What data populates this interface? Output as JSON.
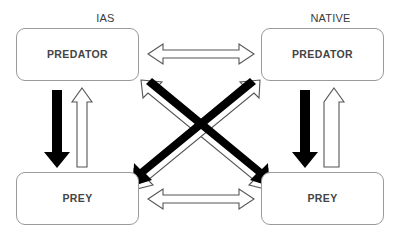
{
  "diagram": {
    "groups": [
      {
        "id": "ias",
        "label": "IAS"
      },
      {
        "id": "native",
        "label": "NATIVE"
      }
    ],
    "nodes": [
      {
        "id": "ias-predator",
        "label": "PREDATOR",
        "group": "IAS"
      },
      {
        "id": "native-predator",
        "label": "PREDATOR",
        "group": "NATIVE"
      },
      {
        "id": "ias-prey",
        "label": "PREY",
        "group": "IAS"
      },
      {
        "id": "native-prey",
        "label": "PREY",
        "group": "NATIVE"
      }
    ],
    "arrows": [
      {
        "id": "ias-predator-to-ias-prey",
        "style": "solid-black",
        "heads": "single",
        "from": "ias-predator",
        "to": "ias-prey",
        "orientation": "vertical-down"
      },
      {
        "id": "ias-prey-to-ias-predator",
        "style": "hollow-white",
        "heads": "single",
        "from": "ias-prey",
        "to": "ias-predator",
        "orientation": "vertical-up"
      },
      {
        "id": "native-predator-to-native-prey",
        "style": "solid-black",
        "heads": "single",
        "from": "native-predator",
        "to": "native-prey",
        "orientation": "vertical-down"
      },
      {
        "id": "native-prey-to-native-predator",
        "style": "hollow-white",
        "heads": "single",
        "from": "native-prey",
        "to": "native-predator",
        "orientation": "vertical-up"
      },
      {
        "id": "predator-predator-competition",
        "style": "hollow-white",
        "heads": "double",
        "from": "ias-predator",
        "to": "native-predator",
        "orientation": "horizontal"
      },
      {
        "id": "prey-prey-competition",
        "style": "hollow-white",
        "heads": "double",
        "from": "ias-prey",
        "to": "native-prey",
        "orientation": "horizontal"
      },
      {
        "id": "ias-predator-to-native-prey",
        "style": "solid-black",
        "heads": "single",
        "from": "ias-predator",
        "to": "native-prey",
        "orientation": "diagonal-down-right"
      },
      {
        "id": "native-prey-to-ias-predator",
        "style": "hollow-white",
        "heads": "single",
        "from": "native-prey",
        "to": "ias-predator",
        "orientation": "diagonal-up-left"
      },
      {
        "id": "native-predator-to-ias-prey",
        "style": "solid-black",
        "heads": "single",
        "from": "native-predator",
        "to": "ias-prey",
        "orientation": "diagonal-down-left"
      },
      {
        "id": "ias-prey-to-native-predator",
        "style": "hollow-white",
        "heads": "single",
        "from": "ias-prey",
        "to": "native-predator",
        "orientation": "diagonal-up-right"
      }
    ],
    "colors": {
      "solid_arrow": "#000000",
      "hollow_arrow_fill": "#ffffff",
      "hollow_arrow_stroke": "#555555",
      "box_border": "#9a9a9a",
      "box_fill": "#ffffff",
      "node_text": "#444444",
      "group_text": "#3a3a3a",
      "background": "#ffffff"
    }
  }
}
